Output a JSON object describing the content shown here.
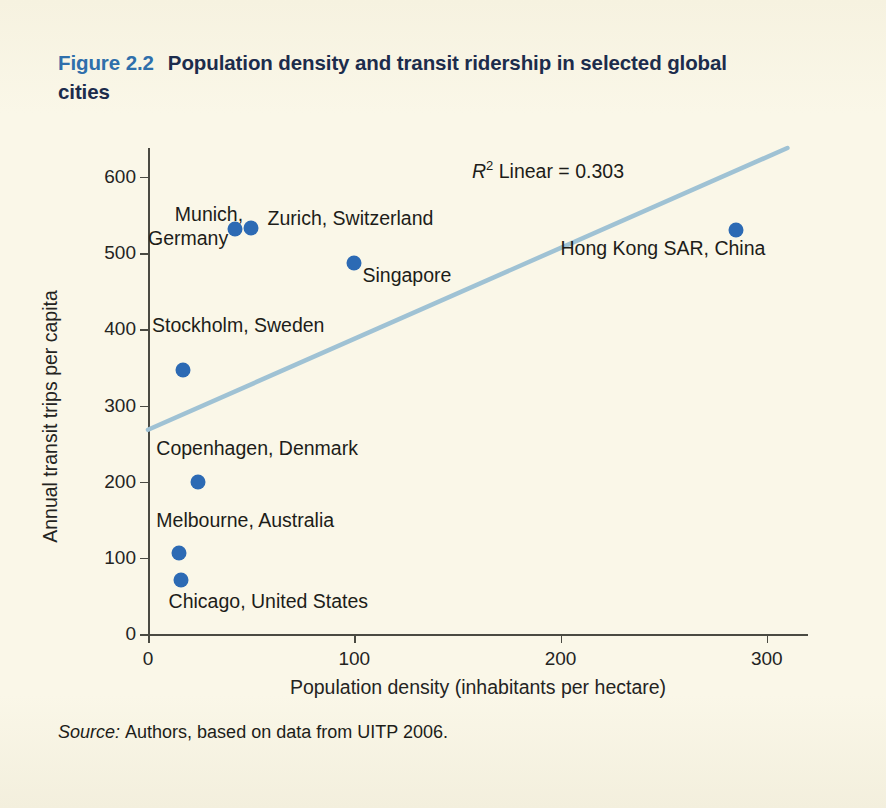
{
  "figure": {
    "number": "Figure 2.2",
    "title": "Population density and transit ridership in selected global cities",
    "number_color": "#2f6fab",
    "title_color": "#1c2c4c"
  },
  "source": {
    "label": "Source:",
    "text": "Authors, based on data from UITP 2006."
  },
  "annotation": {
    "r_symbol": "R",
    "r_exponent": "2",
    "r2_text": " Linear = 0.303",
    "r2_value": 0.303
  },
  "axis_ticks": {
    "y": [
      "0",
      "100",
      "200",
      "300",
      "400",
      "500",
      "600"
    ],
    "x": [
      "0",
      "100",
      "200",
      "300"
    ]
  },
  "chart_data": {
    "type": "scatter",
    "title": "Population density and transit ridership in selected global cities",
    "xlabel": "Population density (inhabitants per hectare)",
    "ylabel": "Annual transit trips per capita",
    "xlim": [
      0,
      320
    ],
    "ylim": [
      0,
      638
    ],
    "xticks": [
      0,
      100,
      200,
      300
    ],
    "yticks": [
      0,
      100,
      200,
      300,
      400,
      500,
      600
    ],
    "grid": false,
    "legend": false,
    "point_color": "#2c6ab4",
    "trendline_color": "#9fc2d4",
    "annotations": [
      "R² Linear = 0.303"
    ],
    "trendline": {
      "type": "linear",
      "r_squared": 0.303,
      "x_start": 0,
      "y_start": 268,
      "x_end": 310,
      "y_end": 638
    },
    "points": [
      {
        "label": "Munich, Germany",
        "x": 42,
        "y": 532
      },
      {
        "label": "Zurich, Switzerland",
        "x": 50,
        "y": 533
      },
      {
        "label": "Singapore",
        "x": 100,
        "y": 487
      },
      {
        "label": "Hong Kong SAR, China",
        "x": 285,
        "y": 531
      },
      {
        "label": "Stockholm, Sweden",
        "x": 17,
        "y": 347
      },
      {
        "label": "Copenhagen, Denmark",
        "x": 24,
        "y": 200
      },
      {
        "label": "Melbourne, Australia",
        "x": 15,
        "y": 107
      },
      {
        "label": "Chicago, United States",
        "x": 16,
        "y": 71
      }
    ],
    "point_labels": [
      {
        "text": "Munich,",
        "x": 13,
        "y": 550
      },
      {
        "text": "Germany",
        "x": 0,
        "y": 518
      },
      {
        "text": "Zurich, Switzerland",
        "x": 58,
        "y": 545
      },
      {
        "text": "Singapore",
        "x": 104,
        "y": 470
      },
      {
        "text": "Hong Kong SAR, China",
        "x": 200,
        "y": 505
      },
      {
        "text": "Stockholm, Sweden",
        "x": 2,
        "y": 405
      },
      {
        "text": "Copenhagen, Denmark",
        "x": 4,
        "y": 243
      },
      {
        "text": "Melbourne, Australia",
        "x": 4,
        "y": 148
      },
      {
        "text": "Chicago, United States",
        "x": 10,
        "y": 42
      }
    ]
  }
}
